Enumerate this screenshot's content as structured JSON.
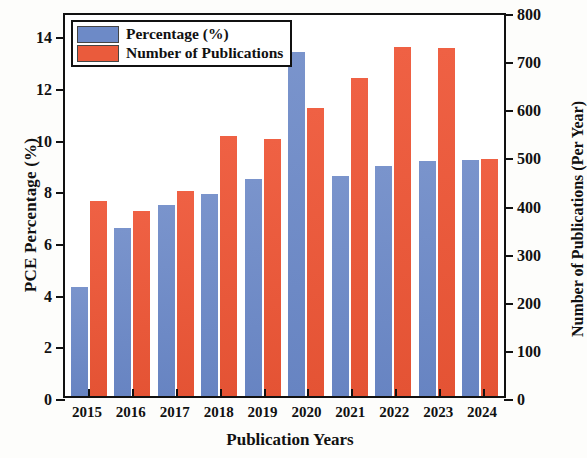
{
  "chart_data": {
    "type": "bar",
    "title": "",
    "xlabel": "Publication Years",
    "ylabel": "PCE Percentage (%)",
    "ylabel_right": "Number of Publications (Per Year)",
    "categories": [
      "2015",
      "2016",
      "2017",
      "2018",
      "2019",
      "2020",
      "2021",
      "2022",
      "2023",
      "2024"
    ],
    "series": [
      {
        "name": "Percentage (%)",
        "axis": "left",
        "color": "#6d8ac7",
        "values": [
          4.2,
          6.5,
          7.4,
          7.8,
          8.4,
          13.3,
          8.5,
          8.9,
          9.1,
          9.15
        ]
      },
      {
        "name": "Number of Publications",
        "axis": "right",
        "color": "#ea5b3c",
        "values": [
          405,
          385,
          425,
          540,
          535,
          598,
          660,
          725,
          723,
          492
        ]
      }
    ],
    "ylim": [
      0,
      14.9
    ],
    "ylim_right": [
      0,
      800
    ],
    "yticks": [
      "0",
      "2",
      "4",
      "6",
      "8",
      "10",
      "12",
      "14"
    ],
    "ytick_values": [
      0,
      2,
      4,
      6,
      8,
      10,
      12,
      14
    ],
    "yticks_right": [
      "0",
      "100",
      "200",
      "300",
      "400",
      "500",
      "600",
      "700",
      "800"
    ],
    "ytick_values_right": [
      0,
      100,
      200,
      300,
      400,
      500,
      600,
      700,
      800
    ],
    "grid": false,
    "legend_position": "top-left",
    "legend": [
      "Percentage (%)",
      "Number of Publications"
    ]
  }
}
